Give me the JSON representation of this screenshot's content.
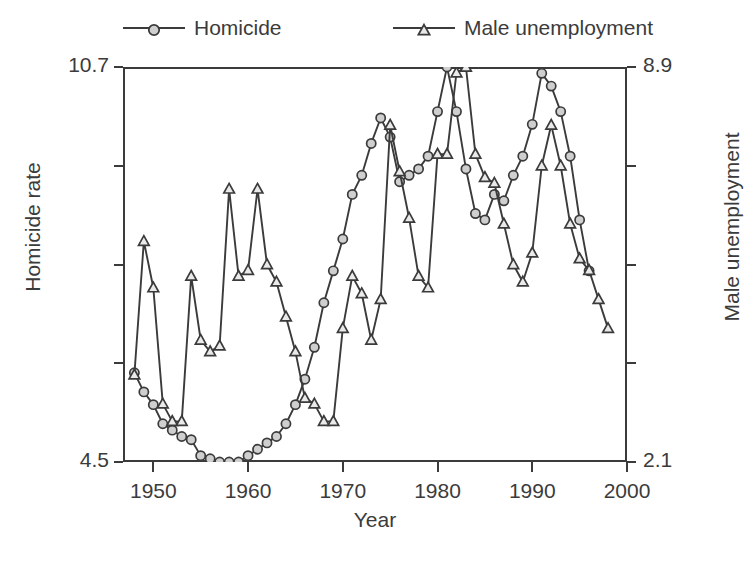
{
  "chart_data": {
    "type": "line",
    "title": "",
    "xlabel": "Year",
    "ylabel": "Homicide rate",
    "ylabel_right": "Male unemployment",
    "xlim": [
      1946.8,
      2000.0
    ],
    "xticks": [
      1950,
      1960,
      1970,
      1980,
      1990,
      2000
    ],
    "xticklabels": [
      "1950",
      "1960",
      "1970",
      "1980",
      "1990",
      "2000"
    ],
    "ylim": [
      4.5,
      10.7
    ],
    "yticks": [
      4.5,
      6.05,
      7.6,
      9.15,
      10.7
    ],
    "yticklabels": [
      "4.5",
      "",
      "",
      "",
      "10.7"
    ],
    "ylim_right": [
      2.1,
      8.9
    ],
    "yticks_right": [
      2.1,
      3.8,
      5.5,
      7.2,
      8.9
    ],
    "yticklabels_right": [
      "2.1",
      "",
      "",
      "",
      "8.9"
    ],
    "grid": false,
    "legend_position": "above-plot",
    "series": [
      {
        "name": "Homicide",
        "axis": "left",
        "marker": "circle",
        "color": "#3b3b3b",
        "x": [
          1948,
          1949,
          1950,
          1951,
          1952,
          1953,
          1954,
          1955,
          1956,
          1957,
          1958,
          1959,
          1960,
          1961,
          1962,
          1963,
          1964,
          1965,
          1966,
          1967,
          1968,
          1969,
          1970,
          1971,
          1972,
          1973,
          1974,
          1975,
          1976,
          1977,
          1978,
          1979,
          1980,
          1981,
          1982,
          1983,
          1984,
          1985,
          1986,
          1987,
          1988,
          1989,
          1990,
          1991,
          1992,
          1993,
          1994,
          1995,
          1996
        ],
        "values": [
          5.9,
          5.6,
          5.4,
          5.1,
          5.0,
          4.9,
          4.85,
          4.6,
          4.55,
          4.5,
          4.5,
          4.5,
          4.6,
          4.7,
          4.8,
          4.9,
          5.1,
          5.4,
          5.8,
          6.3,
          7.0,
          7.5,
          8.0,
          8.7,
          9.0,
          9.5,
          9.9,
          9.6,
          8.9,
          9.0,
          9.1,
          9.3,
          10.0,
          10.7,
          10.0,
          9.1,
          8.4,
          8.3,
          8.7,
          8.6,
          9.0,
          9.3,
          9.8,
          10.6,
          10.4,
          10.0,
          9.3,
          8.3,
          7.5
        ]
      },
      {
        "name": "Male unemployment",
        "axis": "right",
        "marker": "triangle",
        "color": "#3b3b3b",
        "x": [
          1948,
          1949,
          1950,
          1951,
          1952,
          1953,
          1954,
          1955,
          1956,
          1957,
          1958,
          1959,
          1960,
          1961,
          1962,
          1963,
          1964,
          1965,
          1966,
          1967,
          1968,
          1969,
          1970,
          1971,
          1972,
          1973,
          1974,
          1975,
          1976,
          1977,
          1978,
          1979,
          1980,
          1981,
          1982,
          1983,
          1984,
          1985,
          1986,
          1987,
          1988,
          1989,
          1990,
          1991,
          1992,
          1993,
          1994,
          1995,
          1996,
          1997,
          1998
        ],
        "values": [
          3.6,
          5.9,
          5.1,
          3.1,
          2.8,
          2.8,
          5.3,
          4.2,
          4.0,
          4.1,
          6.8,
          5.3,
          5.4,
          6.8,
          5.5,
          5.2,
          4.6,
          4.0,
          3.2,
          3.1,
          2.8,
          2.8,
          4.4,
          5.3,
          5.0,
          4.2,
          4.9,
          7.9,
          7.1,
          6.3,
          5.3,
          5.1,
          7.4,
          7.4,
          8.8,
          8.9,
          7.4,
          7.0,
          6.9,
          6.2,
          5.5,
          5.2,
          5.7,
          7.2,
          7.9,
          7.2,
          6.2,
          5.6,
          5.4,
          4.9,
          4.4
        ]
      }
    ]
  },
  "legend": {
    "entries": [
      {
        "label": "Homicide",
        "marker": "circle-marker-icon"
      },
      {
        "label": "Male unemployment",
        "marker": "triangle-marker-icon"
      }
    ]
  },
  "axes": {
    "left_title": "Homicide rate",
    "right_title": "Male unemployment",
    "bottom_title": "Year",
    "left_top_label": "10.7",
    "left_bottom_label": "4.5",
    "right_top_label": "8.9",
    "right_bottom_label": "2.1"
  }
}
